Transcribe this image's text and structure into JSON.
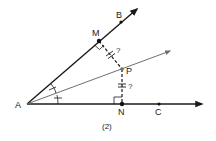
{
  "figure": {
    "caption": "(2)",
    "colors": {
      "ray": "#1a1a1a",
      "bisector": "#6e6e6e",
      "point": "#111111",
      "background": "#ffffff"
    },
    "points": {
      "A": {
        "label": "A",
        "x": 27,
        "y": 104
      },
      "B": {
        "label": "B",
        "x": 121,
        "y": 22
      },
      "M": {
        "label": "M",
        "x": 99,
        "y": 41
      },
      "P": {
        "label": "P",
        "x": 122,
        "y": 69
      },
      "N": {
        "label": "N",
        "x": 122,
        "y": 104
      },
      "C": {
        "label": "C",
        "x": 159,
        "y": 104
      }
    },
    "segments": {
      "MP_question": "?",
      "PN_question": "?"
    },
    "rays": [
      {
        "name": "AB",
        "from": "A",
        "through": "B"
      },
      {
        "name": "AC",
        "from": "A",
        "through": "C"
      },
      {
        "name": "AP",
        "from": "A",
        "through": "P",
        "role": "angle bisector"
      }
    ],
    "marks": {
      "right_angles": [
        "M",
        "N"
      ],
      "congruent_angles": [
        "BAP",
        "PAC"
      ],
      "congruent_segments": [
        "MP",
        "PN"
      ]
    }
  }
}
